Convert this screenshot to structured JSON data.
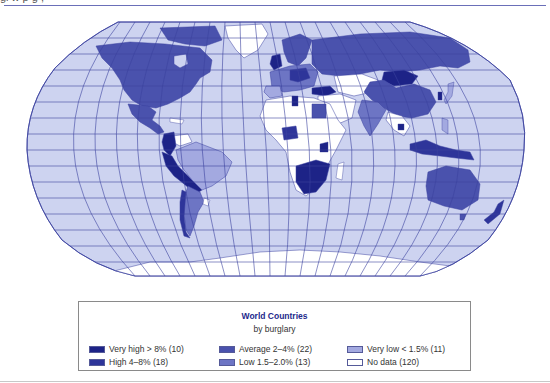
{
  "header": {
    "cut_off_text": "gl     w              p                        g     ,"
  },
  "map": {
    "title": "World Countries",
    "subtitle": "by burglary",
    "projection": "Robinson",
    "colors": {
      "ocean": "#cdd3f0",
      "graticule": "#3c43a0",
      "very_high": "#1d2387",
      "high": "#2e359a",
      "average": "#4a52ad",
      "low": "#6d75c4",
      "very_low": "#a3a9e0",
      "no_data": "#ffffff"
    }
  },
  "legend": {
    "title": "World Countries",
    "subtitle": "by burglary",
    "items": [
      {
        "label": "Very high > 8%  (10)",
        "color": "#1d2387"
      },
      {
        "label": "High 4–8%  (18)",
        "color": "#2e359a"
      },
      {
        "label": "Average 2–4%  (22)",
        "color": "#4a52ad"
      },
      {
        "label": "Low 1.5–2.0%  (13)",
        "color": "#6d75c4"
      },
      {
        "label": "Very low < 1.5%  (11)",
        "color": "#a3a9e0"
      },
      {
        "label": "No data  (120)",
        "color": "#ffffff"
      }
    ]
  }
}
